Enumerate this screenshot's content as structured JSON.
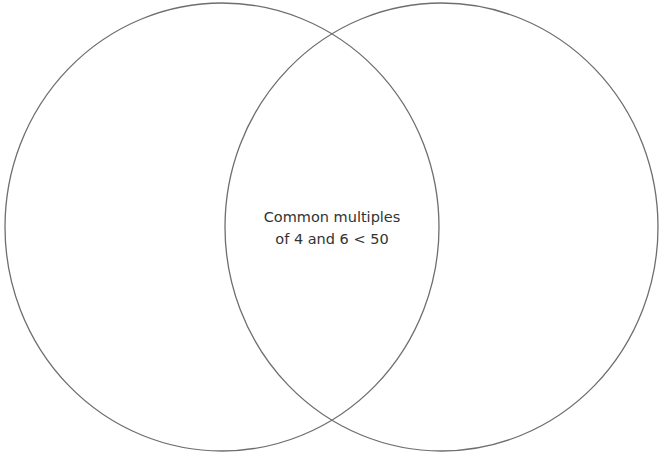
{
  "diagram": {
    "type": "venn",
    "stroke_color": "#6e6e6e",
    "sets": [
      {
        "name": "left",
        "label": ""
      },
      {
        "name": "right",
        "label": ""
      }
    ],
    "intersection": {
      "line1": "Common multiples",
      "line2": "of 4 and 6 < 50"
    }
  }
}
